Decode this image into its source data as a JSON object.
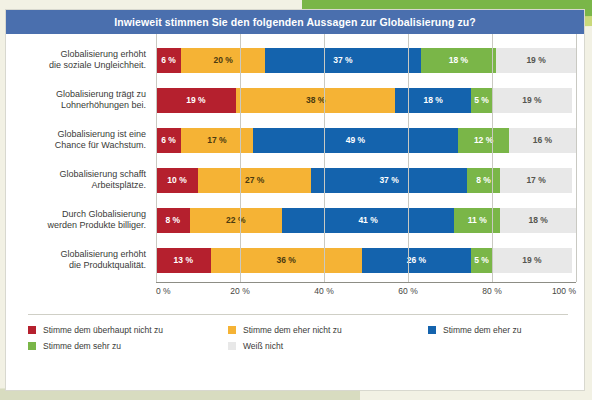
{
  "title": "Inwieweit stimmen Sie den folgenden Aussagen zur Globalisierung zu?",
  "colors": {
    "title_bar": "#4a6fae",
    "strongly_disagree": "#b5202e",
    "somewhat_disagree": "#f5b335",
    "somewhat_agree": "#1463ad",
    "strongly_agree": "#7ab648",
    "dont_know": "#e8e8e8",
    "accent_green": "#7ab648",
    "page_background": "#f2f1e4"
  },
  "legend": [
    {
      "label": "Stimme dem überhaupt nicht zu",
      "color": "#b5202e"
    },
    {
      "label": "Stimme dem eher nicht zu",
      "color": "#f5b335"
    },
    {
      "label": "Stimme dem eher zu",
      "color": "#1463ad"
    },
    {
      "label": "Stimme dem sehr zu",
      "color": "#7ab648"
    },
    {
      "label": "Weiß nicht",
      "color": "#e8e8e8"
    }
  ],
  "axis_ticks": [
    "0 %",
    "20 %",
    "40 %",
    "60 %",
    "80 %",
    "100 %"
  ],
  "rows": [
    {
      "label": "Globalisierung erhöht\ndie soziale Ungleichheit.",
      "values": [
        "6 %",
        "20 %",
        "37 %",
        "18 %",
        "19 %"
      ]
    },
    {
      "label": "Globalisierung trägt zu\nLohnerhöhungen bei.",
      "values": [
        "19 %",
        "38 %",
        "18 %",
        "5 %",
        "19 %"
      ]
    },
    {
      "label": "Globalisierung ist eine\nChance für Wachstum.",
      "values": [
        "6 %",
        "17 %",
        "49 %",
        "12 %",
        "16 %"
      ]
    },
    {
      "label": "Globalisierung schafft\nArbeitsplätze.",
      "values": [
        "10 %",
        "27 %",
        "37 %",
        "8 %",
        "17 %"
      ]
    },
    {
      "label": "Durch Globalisierung\nwerden Produkte billiger.",
      "values": [
        "8 %",
        "22 %",
        "41 %",
        "11 %",
        "18 %"
      ]
    },
    {
      "label": "Globalisierung erhöht\ndie Produktqualität.",
      "values": [
        "13 %",
        "36 %",
        "26 %",
        "5 %",
        "19 %"
      ]
    }
  ],
  "chart_data": {
    "type": "bar",
    "title": "Inwieweit stimmen Sie den folgenden Aussagen zur Globalisierung zu?",
    "orientation": "horizontal",
    "stacked": true,
    "stack_total": 100,
    "xlabel": "",
    "ylabel": "",
    "xlim": [
      0,
      100
    ],
    "grid": true,
    "legend_position": "bottom",
    "xticks": [
      0,
      20,
      40,
      60,
      80,
      100
    ],
    "xticklabels": [
      "0 %",
      "20 %",
      "40 %",
      "60 %",
      "80 %",
      "100 %"
    ],
    "categories": [
      "Globalisierung erhöht die soziale Ungleichheit.",
      "Globalisierung trägt zu Lohnerhöhungen bei.",
      "Globalisierung ist eine Chance für Wachstum.",
      "Globalisierung schafft Arbeitsplätze.",
      "Durch Globalisierung werden Produkte billiger.",
      "Globalisierung erhöht die Produktqualität."
    ],
    "series": [
      {
        "name": "Stimme dem überhaupt nicht zu",
        "color": "#b5202e",
        "values": [
          6,
          19,
          6,
          10,
          8,
          13
        ]
      },
      {
        "name": "Stimme dem eher nicht zu",
        "color": "#f5b335",
        "values": [
          20,
          38,
          17,
          27,
          22,
          36
        ]
      },
      {
        "name": "Stimme dem eher zu",
        "color": "#1463ad",
        "values": [
          37,
          18,
          49,
          37,
          41,
          26
        ]
      },
      {
        "name": "Stimme dem sehr zu",
        "color": "#7ab648",
        "values": [
          18,
          5,
          12,
          8,
          11,
          5
        ]
      },
      {
        "name": "Weiß nicht",
        "color": "#e8e8e8",
        "values": [
          19,
          19,
          16,
          17,
          18,
          19
        ]
      }
    ]
  }
}
